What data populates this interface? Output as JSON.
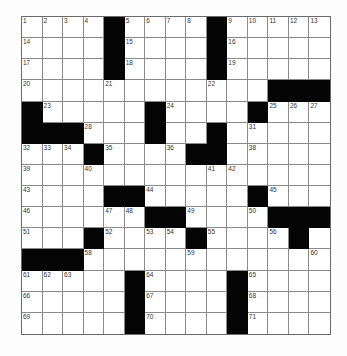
{
  "puzzle": {
    "rows": 15,
    "cols": 15,
    "colors": {
      "block": "#050505",
      "cell": "#ffffff",
      "gridline": "#8a8a8a",
      "number": "#333333"
    },
    "layout": [
      "....#....#.....",
      "....#....#.....",
      "....#....#.....",
      "............###",
      "#.....#....#...",
      "###...#..#.....",
      "...#....##.....",
      "...............",
      "....##.....#...",
      "......##....###",
      "...#....#....#.",
      "###............",
      ".....#....#....",
      ".....#....#....",
      ".....#....#...."
    ],
    "numbers": [
      {
        "r": 0,
        "c": 0,
        "n": "1"
      },
      {
        "r": 0,
        "c": 1,
        "n": "2"
      },
      {
        "r": 0,
        "c": 2,
        "n": "3"
      },
      {
        "r": 0,
        "c": 3,
        "n": "4"
      },
      {
        "r": 0,
        "c": 5,
        "n": "5"
      },
      {
        "r": 0,
        "c": 6,
        "n": "6"
      },
      {
        "r": 0,
        "c": 7,
        "n": "7"
      },
      {
        "r": 0,
        "c": 8,
        "n": "8"
      },
      {
        "r": 0,
        "c": 10,
        "n": "9"
      },
      {
        "r": 0,
        "c": 11,
        "n": "10"
      },
      {
        "r": 0,
        "c": 12,
        "n": "11"
      },
      {
        "r": 0,
        "c": 13,
        "n": "12"
      },
      {
        "r": 0,
        "c": 14,
        "n": "13"
      },
      {
        "r": 1,
        "c": 0,
        "n": "14"
      },
      {
        "r": 1,
        "c": 5,
        "n": "15"
      },
      {
        "r": 1,
        "c": 10,
        "n": "16"
      },
      {
        "r": 2,
        "c": 0,
        "n": "17"
      },
      {
        "r": 2,
        "c": 5,
        "n": "18"
      },
      {
        "r": 2,
        "c": 10,
        "n": "19"
      },
      {
        "r": 3,
        "c": 0,
        "n": "20"
      },
      {
        "r": 3,
        "c": 4,
        "n": "21"
      },
      {
        "r": 3,
        "c": 9,
        "n": "22"
      },
      {
        "r": 4,
        "c": 1,
        "n": "23"
      },
      {
        "r": 4,
        "c": 7,
        "n": "24"
      },
      {
        "r": 4,
        "c": 12,
        "n": "25"
      },
      {
        "r": 4,
        "c": 13,
        "n": "26"
      },
      {
        "r": 4,
        "c": 14,
        "n": "27"
      },
      {
        "r": 5,
        "c": 3,
        "n": "28"
      },
      {
        "r": 5,
        "c": 6,
        "n": "29"
      },
      {
        "r": 5,
        "c": 9,
        "n": "30"
      },
      {
        "r": 5,
        "c": 11,
        "n": "31"
      },
      {
        "r": 6,
        "c": 0,
        "n": "32"
      },
      {
        "r": 6,
        "c": 1,
        "n": "33"
      },
      {
        "r": 6,
        "c": 2,
        "n": "34"
      },
      {
        "r": 6,
        "c": 4,
        "n": "35"
      },
      {
        "r": 6,
        "c": 7,
        "n": "36"
      },
      {
        "r": 6,
        "c": 8,
        "n": "37"
      },
      {
        "r": 6,
        "c": 11,
        "n": "38"
      },
      {
        "r": 7,
        "c": 0,
        "n": "39"
      },
      {
        "r": 7,
        "c": 3,
        "n": "40"
      },
      {
        "r": 7,
        "c": 9,
        "n": "41"
      },
      {
        "r": 7,
        "c": 10,
        "n": "42"
      },
      {
        "r": 8,
        "c": 0,
        "n": "43"
      },
      {
        "r": 8,
        "c": 6,
        "n": "44"
      },
      {
        "r": 8,
        "c": 12,
        "n": "45"
      },
      {
        "r": 9,
        "c": 0,
        "n": "46"
      },
      {
        "r": 9,
        "c": 4,
        "n": "47"
      },
      {
        "r": 9,
        "c": 5,
        "n": "48"
      },
      {
        "r": 9,
        "c": 8,
        "n": "49"
      },
      {
        "r": 9,
        "c": 11,
        "n": "50"
      },
      {
        "r": 10,
        "c": 0,
        "n": "51"
      },
      {
        "r": 10,
        "c": 4,
        "n": "52"
      },
      {
        "r": 10,
        "c": 6,
        "n": "53"
      },
      {
        "r": 10,
        "c": 7,
        "n": "54"
      },
      {
        "r": 10,
        "c": 9,
        "n": "55"
      },
      {
        "r": 10,
        "c": 12,
        "n": "56"
      },
      {
        "r": 10,
        "c": 13,
        "n": "57"
      },
      {
        "r": 11,
        "c": 3,
        "n": "58"
      },
      {
        "r": 11,
        "c": 8,
        "n": "59"
      },
      {
        "r": 11,
        "c": 14,
        "n": "60"
      },
      {
        "r": 12,
        "c": 0,
        "n": "61"
      },
      {
        "r": 12,
        "c": 1,
        "n": "62"
      },
      {
        "r": 12,
        "c": 2,
        "n": "63"
      },
      {
        "r": 12,
        "c": 6,
        "n": "64"
      },
      {
        "r": 12,
        "c": 11,
        "n": "65"
      },
      {
        "r": 13,
        "c": 0,
        "n": "66"
      },
      {
        "r": 13,
        "c": 6,
        "n": "67"
      },
      {
        "r": 13,
        "c": 11,
        "n": "68"
      },
      {
        "r": 14,
        "c": 0,
        "n": "69"
      },
      {
        "r": 14,
        "c": 6,
        "n": "70"
      },
      {
        "r": 14,
        "c": 11,
        "n": "71"
      }
    ]
  }
}
